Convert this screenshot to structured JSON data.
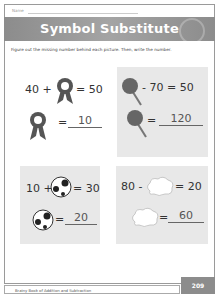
{
  "header": {
    "name_label": "Name",
    "title": "Symbol Substitute"
  },
  "instructions": "Figure out the missing number behind each picture. Then, write the number.",
  "problems": [
    {
      "symbol": "ribbon-award",
      "equation_left": "40 +",
      "equation_right": "= 50",
      "answer": "10"
    },
    {
      "symbol": "lollipop",
      "equation_left": "",
      "equation_right": "- 70 = 50",
      "answer": "120"
    },
    {
      "symbol": "soccer-ball",
      "equation_left": "10 +",
      "equation_right": "= 30",
      "answer": "20"
    },
    {
      "symbol": "cloud",
      "equation_left": "80 -",
      "equation_right": "= 20",
      "answer": "60"
    }
  ],
  "answer_prefix": "=",
  "footer": {
    "book_title": "Brainy Book of Addition and Subtraction",
    "page_number": "209"
  },
  "colors": {
    "banner": "#8c8c8c",
    "box_fill": "#e8e8e8"
  }
}
